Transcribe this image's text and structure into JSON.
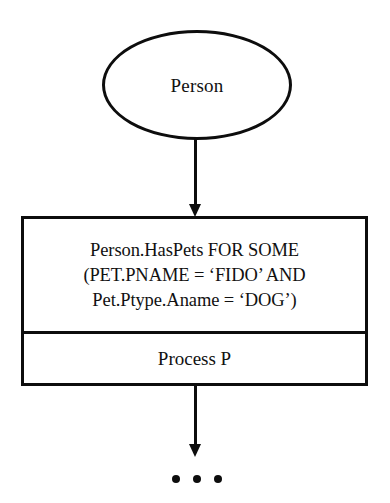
{
  "diagram": {
    "type": "flowchart",
    "background_color": "#ffffff",
    "stroke_color": "#0d0d0d",
    "text_color": "#111111",
    "start_node": {
      "shape": "ellipse",
      "label": "Person"
    },
    "process_box": {
      "shape": "rectangle",
      "condition_cell": {
        "lines": [
          "Person.HasPets FOR SOME",
          "(PET.PNAME = ‘FIDO’ AND",
          "Pet.Ptype.Aname = ‘DOG’)"
        ]
      },
      "process_cell": {
        "label": "Process P"
      }
    },
    "connectors": [
      {
        "name": "person-to-box",
        "from": "Person",
        "to": "Person.HasPets FOR SOME",
        "arrowhead": "down"
      },
      {
        "name": "box-to-continuation",
        "from": "Process P",
        "to": "continuation",
        "arrowhead": "down"
      }
    ],
    "continuation": {
      "symbol": "ellipsis",
      "dot_count": 3
    }
  }
}
